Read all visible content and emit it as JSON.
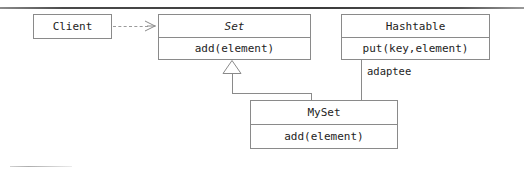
{
  "diagram": {
    "kind": "uml-class-diagram",
    "stroke_color": "#8a8a8a",
    "text_color": "#1d1d1d",
    "rule_color": "#3a3a3a",
    "background": "#ffffff"
  },
  "classes": {
    "client": {
      "name": "Client",
      "abstract": false,
      "operations": []
    },
    "set": {
      "name": "Set",
      "abstract": true,
      "operations": [
        "add(element)"
      ]
    },
    "hashtable": {
      "name": "Hashtable",
      "abstract": false,
      "operations": [
        "put(key,element)"
      ]
    },
    "myset": {
      "name": "MySet",
      "abstract": false,
      "operations": [
        "add(element)"
      ]
    }
  },
  "relationships": [
    {
      "id": "client-uses-set",
      "type": "dependency",
      "style": "dashed",
      "arrowhead": "open-stick",
      "from": "Client",
      "to": "Set",
      "label": ""
    },
    {
      "id": "myset-inherits-set",
      "type": "generalization",
      "style": "solid",
      "arrowhead": "hollow-triangle",
      "from": "MySet",
      "to": "Set",
      "label": ""
    },
    {
      "id": "myset-adaptee-hashtable",
      "type": "association",
      "style": "solid",
      "arrowhead": "none",
      "from": "Hashtable",
      "to": "MySet",
      "label": "adaptee"
    }
  ],
  "labels": {
    "adaptee": "adaptee"
  }
}
